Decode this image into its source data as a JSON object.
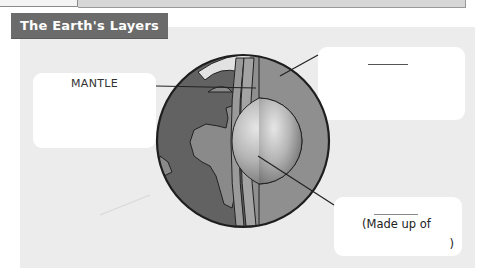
{
  "header": {
    "title": "The Earth's Layers"
  },
  "labels": {
    "mantle": "MANTLE",
    "crust_blank": "",
    "core_made_up_of": "(Made up of",
    "core_close_paren": ")"
  },
  "diagram": {
    "layers": [
      "crust",
      "mantle",
      "core"
    ],
    "colors": {
      "panel_bg": "#ececec",
      "title_bg": "#6b6b6b",
      "land": "#7a7a7a",
      "ocean": "#5f5f5f",
      "mantle": "#8e8e8e",
      "core_light": "#d8d8d8",
      "core_dark": "#7c7c7c"
    }
  }
}
